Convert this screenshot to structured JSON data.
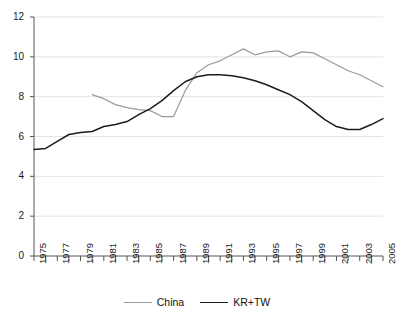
{
  "chart_data": {
    "type": "line",
    "title": "",
    "xlabel": "",
    "ylabel": "",
    "xlim": [
      1975,
      2005
    ],
    "ylim": [
      0,
      12
    ],
    "yticks": [
      0,
      2,
      4,
      6,
      8,
      10,
      12
    ],
    "grid": true,
    "grid_axis": "y",
    "legend_position": "bottom",
    "x": [
      1975,
      1976,
      1977,
      1978,
      1979,
      1980,
      1981,
      1982,
      1983,
      1984,
      1985,
      1986,
      1987,
      1988,
      1989,
      1990,
      1991,
      1992,
      1993,
      1994,
      1995,
      1996,
      1997,
      1998,
      1999,
      2000,
      2001,
      2002,
      2003,
      2004,
      2005
    ],
    "xtick_labels": [
      "1975",
      "",
      "1977",
      "",
      "1979",
      "",
      "1981",
      "",
      "1983",
      "",
      "1985",
      "",
      "1987",
      "",
      "1989",
      "",
      "1991",
      "",
      "1993",
      "",
      "1995",
      "",
      "1997",
      "",
      "1999",
      "",
      "2001",
      "",
      "2003",
      "",
      "2005"
    ],
    "series": [
      {
        "name": "China",
        "color": "#9a9a9a",
        "values": [
          null,
          null,
          null,
          null,
          null,
          8.1,
          7.9,
          7.6,
          7.45,
          7.35,
          7.3,
          7.0,
          7.0,
          8.3,
          9.2,
          9.6,
          9.8,
          10.1,
          10.4,
          10.1,
          10.25,
          10.3,
          10.0,
          10.25,
          10.2,
          9.9,
          9.6,
          9.3,
          9.1,
          8.8,
          8.5
        ]
      },
      {
        "name": "KR+TW",
        "color": "#1c1c1c",
        "values": [
          5.35,
          5.4,
          5.75,
          6.1,
          6.2,
          6.25,
          6.5,
          6.6,
          6.75,
          7.1,
          7.4,
          7.8,
          8.3,
          8.75,
          9.0,
          9.1,
          9.1,
          9.05,
          8.95,
          8.8,
          8.6,
          8.35,
          8.1,
          7.75,
          7.3,
          6.85,
          6.5,
          6.35,
          6.35,
          6.6,
          6.9
        ]
      }
    ]
  },
  "legend": {
    "items": [
      {
        "label": "China",
        "color": "#9a9a9a"
      },
      {
        "label": "KR+TW",
        "color": "#1c1c1c"
      }
    ]
  },
  "axes": {
    "y_axis_color": "#555555",
    "x_axis_color": "#555555",
    "grid_color": "#e4e4e4"
  }
}
